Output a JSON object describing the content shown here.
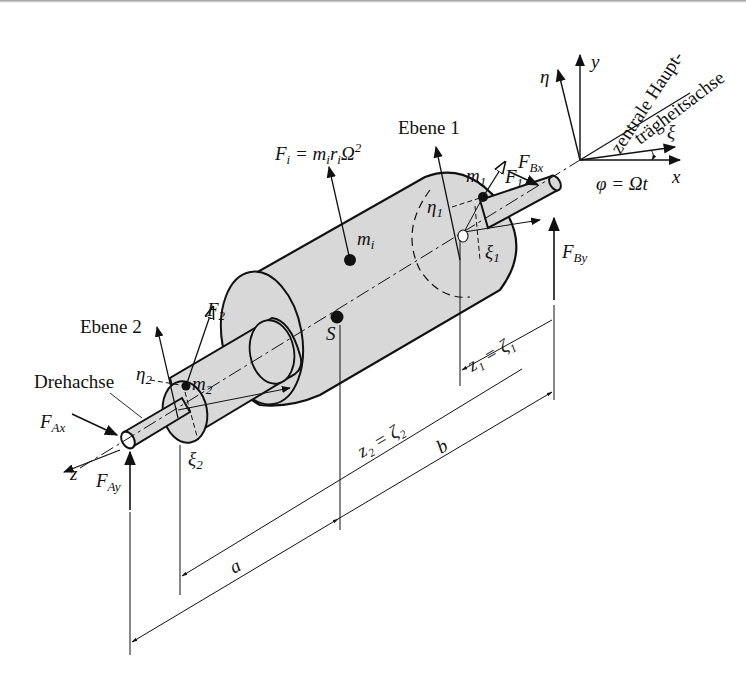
{
  "diagram": {
    "type": "technical-drawing",
    "colors": {
      "line": "#111111",
      "body_fill": "#d8d8d8",
      "background": "#ffffff"
    },
    "labels": {
      "axis_note_line1": "zentrale Haupt-",
      "axis_note_line2": "trägheitsachse",
      "eta": "η",
      "y": "y",
      "xi": "ξ",
      "x": "x",
      "phi_eq": "φ = Ωt",
      "plane1": "Ebene 1",
      "plane2": "Ebene 2",
      "force_i": "Fi = mi ri Ω²",
      "force_i_F": "F",
      "force_i_sub": "i",
      "force_i_rhs": " = m",
      "force_i_rhs_sub1": "i",
      "force_i_r": "r",
      "force_i_rhs_sub2": "i",
      "force_i_omega": "Ω",
      "force_i_sup": "2",
      "FBx_main": "F",
      "FBx_sub": "Bx",
      "FBy_main": "F",
      "FBy_sub": "By",
      "FAx_main": "F",
      "FAx_sub": "Ax",
      "FAy_main": "F",
      "FAy_sub": "Ay",
      "m1_main": "m",
      "m1_sub": "1",
      "F1_main": "F",
      "F1_sub": "1",
      "eta1_main": "η",
      "eta1_sub": "1",
      "xi1_main": "ξ",
      "xi1_sub": "1",
      "mi_main": "m",
      "mi_sub": "i",
      "S": "S",
      "F2_main": "F",
      "F2_sub": "2",
      "eta2_main": "η",
      "eta2_sub": "2",
      "m2_main": "m",
      "m2_sub": "2",
      "xi2_main": "ξ",
      "xi2_sub": "2",
      "rotation_axis": "Drehachse",
      "z": "z",
      "z1_eq": "z₁ = ζ₁",
      "z2_eq": "z₂ = ζ₂",
      "dim_a": "a",
      "dim_b": "b"
    }
  }
}
